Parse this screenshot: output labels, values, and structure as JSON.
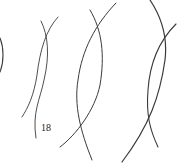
{
  "figure": {
    "label": "18",
    "stroke_color": "#333333",
    "background": "#ffffff"
  }
}
